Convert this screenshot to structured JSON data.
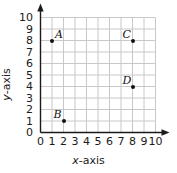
{
  "chart_data": {
    "type": "scatter",
    "title": "",
    "xlabel": "x-axis",
    "ylabel": "y-axis",
    "xlim": [
      0,
      10
    ],
    "ylim": [
      0,
      10
    ],
    "grid": true,
    "legend": null,
    "xticks": [
      "0",
      "1",
      "2",
      "3",
      "4",
      "5",
      "6",
      "7",
      "8",
      "9",
      "10"
    ],
    "yticks": [
      "0",
      "1",
      "2",
      "3",
      "4",
      "5",
      "6",
      "7",
      "8",
      "9",
      "10"
    ],
    "points": [
      {
        "label": "A",
        "x": 1,
        "y": 8,
        "label_pos": "upper-right"
      },
      {
        "label": "B",
        "x": 2,
        "y": 1,
        "label_pos": "upper-left"
      },
      {
        "label": "C",
        "x": 8,
        "y": 8,
        "label_pos": "upper-left"
      },
      {
        "label": "D",
        "x": 8,
        "y": 4,
        "label_pos": "upper-left"
      }
    ],
    "colors": {
      "grid": "#c8c8c8",
      "axis": "#1a1a1a",
      "point": "#111111",
      "background": "#ffffff"
    }
  },
  "axis_titles": {
    "x_italic": "x",
    "x_rest": "-axis",
    "y_italic": "y",
    "y_rest": "-axis"
  }
}
